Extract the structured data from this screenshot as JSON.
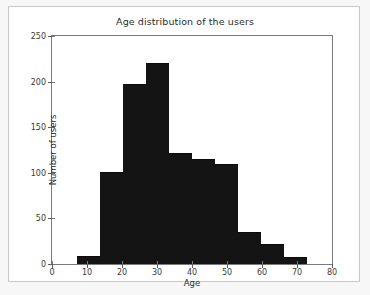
{
  "figure": {
    "background": "#f7f7f7",
    "panel_background": "#ffffff",
    "frame_color": "#c8c8c8"
  },
  "chart_data": {
    "type": "bar",
    "title": "Age distribution of the users",
    "xlabel": "Age",
    "ylabel": "Number of users",
    "xlim": [
      0,
      80
    ],
    "ylim": [
      0,
      250
    ],
    "xticks": [
      0,
      10,
      20,
      30,
      40,
      50,
      60,
      70,
      80
    ],
    "xtick_labels": [
      "0",
      "10",
      "20",
      "30",
      "40",
      "50",
      "60",
      "70",
      "80"
    ],
    "yticks": [
      0,
      50,
      100,
      150,
      200,
      250
    ],
    "ytick_labels": [
      "0",
      "50",
      "100",
      "150",
      "200",
      "250"
    ],
    "grid": false,
    "legend": null,
    "bar_color": "#141414",
    "bin_edges": [
      7.0,
      13.6,
      20.2,
      26.8,
      33.4,
      40.0,
      46.6,
      53.2,
      59.8,
      66.4,
      73.0
    ],
    "categories": [
      "7-13.6",
      "13.6-20.2",
      "20.2-26.8",
      "26.8-33.4",
      "33.4-40",
      "40-46.6",
      "46.6-53.2",
      "53.2-59.8",
      "59.8-66.4",
      "66.4-73"
    ],
    "values": [
      9,
      101,
      197,
      220,
      122,
      115,
      110,
      35,
      22,
      8
    ]
  }
}
